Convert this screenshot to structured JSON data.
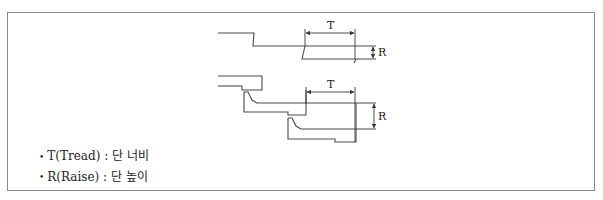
{
  "figure": {
    "labels": {
      "tread_symbol": "T",
      "raise_symbol": "R"
    },
    "legend": [
      {
        "symbol": "T",
        "term": "T(Tread)",
        "separator": " : ",
        "meaning": "단 너비"
      },
      {
        "symbol": "R",
        "term": "R(Raise)",
        "separator": " : ",
        "meaning": "단 높이"
      }
    ],
    "colors": {
      "line": "#4a4a4a",
      "frame": "#8a8a8a",
      "text": "#222222"
    }
  }
}
